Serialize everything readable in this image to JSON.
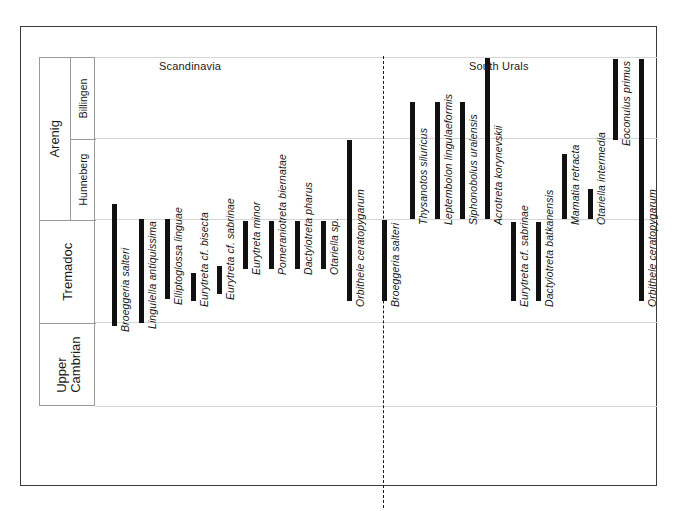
{
  "figure": {
    "regions": [
      {
        "id": "scandinavia",
        "label": "Scandinavia"
      },
      {
        "id": "south-urals",
        "label": "South  Urals"
      }
    ],
    "bar_color": "#111111",
    "frame_color": "#3a3a3a",
    "grid_color": "#d6d6d6"
  },
  "stratigraphy": {
    "series": [
      {
        "label": "Arenig",
        "top_px": 56,
        "bottom_px": 218
      },
      {
        "label": "Tremadoc",
        "top_px": 218,
        "bottom_px": 321
      },
      {
        "label": "Upper\nCambrian",
        "top_px": 321,
        "bottom_px": 405
      }
    ],
    "stages": [
      {
        "label": "Billingen",
        "top_px": 56,
        "bottom_px": 137
      },
      {
        "label": "Hunneberg",
        "top_px": 137,
        "bottom_px": 218
      }
    ],
    "upper_cambrian_line1": "Upper",
    "upper_cambrian_line2": "Cambrian"
  },
  "chart_data": {
    "type": "bar",
    "orientation": "vertical-ranges",
    "xlabel": "",
    "ylabel": "Stratigraphic stage",
    "grid": true,
    "y_axis": {
      "kind": "categorical-stratigraphic",
      "top_label": "Arenig (Billingen)",
      "bottom_label": "Upper Cambrian",
      "boundaries_px": [
        56,
        137,
        218,
        321,
        405
      ],
      "boundary_names": [
        "top-of-Billingen",
        "Billingen/Hunneberg",
        "Hunneberg/Tremadoc",
        "Tremadoc/Upper-Cambrian",
        "base-of-Upper-Cambrian"
      ]
    },
    "legend_position": "none",
    "series": [
      {
        "name": "Scandinavia",
        "values": [
          {
            "taxon": "Broeggeria salteri",
            "x_px": 111,
            "top_px": 203,
            "bottom_px": 325,
            "top_stage": "Hunneberg",
            "bottom_stage": "Upper Cambrian"
          },
          {
            "taxon": "Lingulella antiquissima",
            "x_px": 138,
            "top_px": 218,
            "bottom_px": 322,
            "top_stage": "Hunneberg/Tremadoc",
            "bottom_stage": "Upper Cambrian"
          },
          {
            "taxon": "Elliptoglossa linguae",
            "x_px": 164,
            "top_px": 218,
            "bottom_px": 298,
            "top_stage": "Hunneberg/Tremadoc",
            "bottom_stage": "Tremadoc"
          },
          {
            "taxon": "Eurytreta cf. bisecta",
            "x_px": 190,
            "top_px": 272,
            "bottom_px": 300,
            "top_stage": "Tremadoc",
            "bottom_stage": "Tremadoc"
          },
          {
            "taxon": "Eurytreta cf. sabrinae",
            "x_px": 216,
            "top_px": 265,
            "bottom_px": 293,
            "top_stage": "Tremadoc",
            "bottom_stage": "Tremadoc"
          },
          {
            "taxon": "Eurytreta minor",
            "x_px": 242,
            "top_px": 220,
            "bottom_px": 268,
            "top_stage": "Tremadoc",
            "bottom_stage": "Tremadoc"
          },
          {
            "taxon": "Pomeraniotreta biernatae",
            "x_px": 268,
            "top_px": 220,
            "bottom_px": 268,
            "top_stage": "Tremadoc",
            "bottom_stage": "Tremadoc"
          },
          {
            "taxon": "Dactylotreta pharus",
            "x_px": 294,
            "top_px": 220,
            "bottom_px": 268,
            "top_stage": "Tremadoc",
            "bottom_stage": "Tremadoc"
          },
          {
            "taxon": "Otariella sp.",
            "x_px": 320,
            "top_px": 220,
            "bottom_px": 268,
            "top_stage": "Tremadoc",
            "bottom_stage": "Tremadoc"
          },
          {
            "taxon": "Orbithele ceratopygarum",
            "x_px": 346,
            "top_px": 139,
            "bottom_px": 300,
            "top_stage": "Hunneberg",
            "bottom_stage": "Tremadoc"
          }
        ]
      },
      {
        "name": "South Urals",
        "values": [
          {
            "taxon": "Broeggeria salteri",
            "x_px": 381,
            "top_px": 219,
            "bottom_px": 300,
            "top_stage": "Hunneberg/Tremadoc",
            "bottom_stage": "Tremadoc"
          },
          {
            "taxon": "Thysanotos siluricus",
            "x_px": 409,
            "top_px": 101,
            "bottom_px": 218,
            "top_stage": "Billingen",
            "bottom_stage": "Hunneberg/Tremadoc"
          },
          {
            "taxon": "Leptembolon lingulaeformis",
            "x_px": 434,
            "top_px": 101,
            "bottom_px": 218,
            "top_stage": "Billingen",
            "bottom_stage": "Hunneberg/Tremadoc"
          },
          {
            "taxon": "Siphonobolus uralensis",
            "x_px": 459,
            "top_px": 101,
            "bottom_px": 218,
            "top_stage": "Billingen",
            "bottom_stage": "Hunneberg/Tremadoc"
          },
          {
            "taxon": "Acrotreta korynevskii",
            "x_px": 484,
            "top_px": 57,
            "bottom_px": 218,
            "top_stage": "Billingen",
            "bottom_stage": "Hunneberg/Tremadoc"
          },
          {
            "taxon": "Eurytreta cf. sabrinae",
            "x_px": 510,
            "top_px": 221,
            "bottom_px": 300,
            "top_stage": "Tremadoc",
            "bottom_stage": "Tremadoc"
          },
          {
            "taxon": "Dactylotreta batkanensis",
            "x_px": 535,
            "top_px": 221,
            "bottom_px": 300,
            "top_stage": "Tremadoc",
            "bottom_stage": "Tremadoc"
          },
          {
            "taxon": "Mamatia retracta",
            "x_px": 561,
            "top_px": 153,
            "bottom_px": 218,
            "top_stage": "Hunneberg",
            "bottom_stage": "Hunneberg/Tremadoc"
          },
          {
            "taxon": "Otariella intermedia",
            "x_px": 587,
            "top_px": 188,
            "bottom_px": 218,
            "top_stage": "Hunneberg",
            "bottom_stage": "Hunneberg/Tremadoc"
          },
          {
            "taxon": "Eoconulus primus",
            "x_px": 612,
            "top_px": 58,
            "bottom_px": 139,
            "top_stage": "Billingen",
            "bottom_stage": "Hunneberg"
          },
          {
            "taxon": "Orbithele ceratopygarum",
            "x_px": 638,
            "top_px": 58,
            "bottom_px": 300,
            "top_stage": "Billingen",
            "bottom_stage": "Tremadoc"
          }
        ]
      }
    ]
  }
}
